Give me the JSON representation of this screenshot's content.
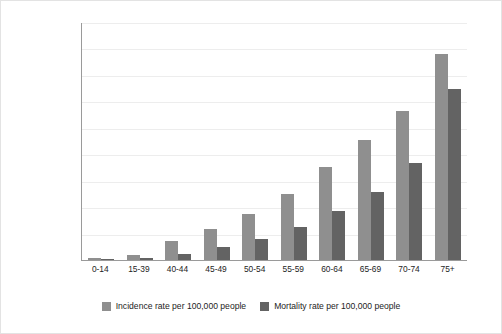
{
  "chart_data": {
    "type": "bar",
    "title": "",
    "xlabel": "",
    "ylabel": "Cancer incidence and mortality rates\nper 100,000 people",
    "ylim": [
      0,
      1800
    ],
    "ytick_step": 200,
    "yticks": [
      0,
      200,
      400,
      600,
      800,
      1000,
      1200,
      1400,
      1600,
      1800
    ],
    "grid": true,
    "legend_position": "bottom",
    "categories": [
      "0-14",
      "15-39",
      "40-44",
      "45-49",
      "50-54",
      "55-59",
      "60-64",
      "65-69",
      "70-74",
      "75+"
    ],
    "series": [
      {
        "name": "Incidence rate per 100,000 people",
        "color": "#8f8f8f",
        "values": [
          15,
          35,
          145,
          235,
          345,
          500,
          700,
          910,
          1130,
          1560
        ]
      },
      {
        "name": "Mortality rate per 100,000 people",
        "color": "#636363",
        "values": [
          5,
          12,
          45,
          95,
          160,
          250,
          370,
          515,
          730,
          1290
        ]
      }
    ]
  },
  "colors": {
    "incidence": "#8f8f8f",
    "mortality": "#636363",
    "gridline": "#ededed",
    "axis": "#9a9a9a",
    "background": "#ffffff"
  }
}
